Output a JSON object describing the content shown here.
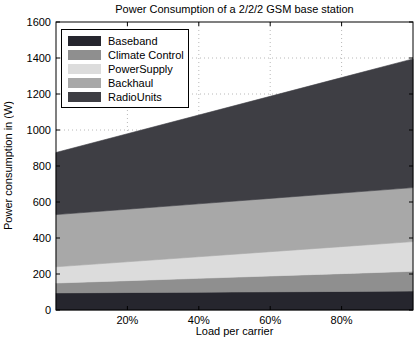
{
  "window": {
    "background": "#ffffff"
  },
  "chart_data": {
    "type": "area",
    "stacked": true,
    "title": "Power Consumption of a 2/2/2 GSM base station",
    "xlabel": "Load per carrier",
    "ylabel": "Power consumption in (W)",
    "xlim": [
      0,
      100
    ],
    "ylim": [
      0,
      1600
    ],
    "grid": "dotted",
    "grid_color": "#b8b8b8",
    "frame_color": "#000000",
    "legend_position": "top-left",
    "x": [
      0,
      20,
      40,
      60,
      80,
      100
    ],
    "x_tick_labels": [
      {
        "value": 20,
        "label": "20%"
      },
      {
        "value": 40,
        "label": "40%"
      },
      {
        "value": 60,
        "label": "60%"
      },
      {
        "value": 80,
        "label": "80%"
      }
    ],
    "y_tick_labels": [
      {
        "value": 0,
        "label": "0"
      },
      {
        "value": 200,
        "label": "200"
      },
      {
        "value": 400,
        "label": "400"
      },
      {
        "value": 600,
        "label": "600"
      },
      {
        "value": 800,
        "label": "800"
      },
      {
        "value": 1000,
        "label": "1000"
      },
      {
        "value": 1200,
        "label": "1200"
      },
      {
        "value": 1400,
        "label": "1400"
      },
      {
        "value": 1600,
        "label": "1600"
      }
    ],
    "series": [
      {
        "name": "Baseband",
        "color": "#26262e",
        "values": [
          95,
          97,
          99,
          101,
          103,
          105
        ]
      },
      {
        "name": "Climate Control",
        "color": "#8f8f8f",
        "values": [
          55,
          66,
          77,
          88,
          99,
          110
        ]
      },
      {
        "name": "PowerSupply",
        "color": "#dcdcdc",
        "values": [
          90,
          105,
          120,
          135,
          150,
          165
        ]
      },
      {
        "name": "Backhaul",
        "color": "#a8a8a8",
        "values": [
          290,
          292,
          294,
          296,
          298,
          300
        ]
      },
      {
        "name": "RadioUnits",
        "color": "#3e3e44",
        "values": [
          345,
          419,
          493,
          567,
          641,
          715
        ]
      }
    ],
    "stack_totals": [
      875,
      979,
      1083,
      1187,
      1291,
      1395
    ]
  }
}
